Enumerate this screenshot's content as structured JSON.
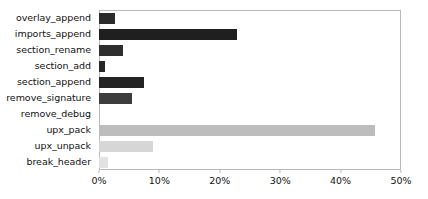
{
  "chart_data": {
    "type": "bar",
    "orientation": "horizontal",
    "title": "",
    "xlabel": "",
    "ylabel": "",
    "xlim": [
      0,
      50
    ],
    "xtick_labels": [
      "0%",
      "10%",
      "20%",
      "30%",
      "40%",
      "50%"
    ],
    "xtick_values": [
      0,
      10,
      20,
      30,
      40,
      50
    ],
    "grid": false,
    "legend": false,
    "categories": [
      "overlay_append",
      "imports_append",
      "section_rename",
      "section_add",
      "section_append",
      "remove_signature",
      "remove_debug",
      "upx_pack",
      "upx_unpack",
      "break_header"
    ],
    "values": [
      2.7,
      22.8,
      4.0,
      1.0,
      7.5,
      5.5,
      0.0,
      45.7,
      9.0,
      1.5
    ],
    "bar_colors": [
      "#2b2b2b",
      "#1f1f1f",
      "#2e2e2e",
      "#262626",
      "#232323",
      "#3d3d3d",
      "#ffffff",
      "#bdbdbd",
      "#d6d6d6",
      "#e2e2e2"
    ],
    "axis_color": "#b8b8b8",
    "background": "#ffffff",
    "text_color": "#111111"
  }
}
